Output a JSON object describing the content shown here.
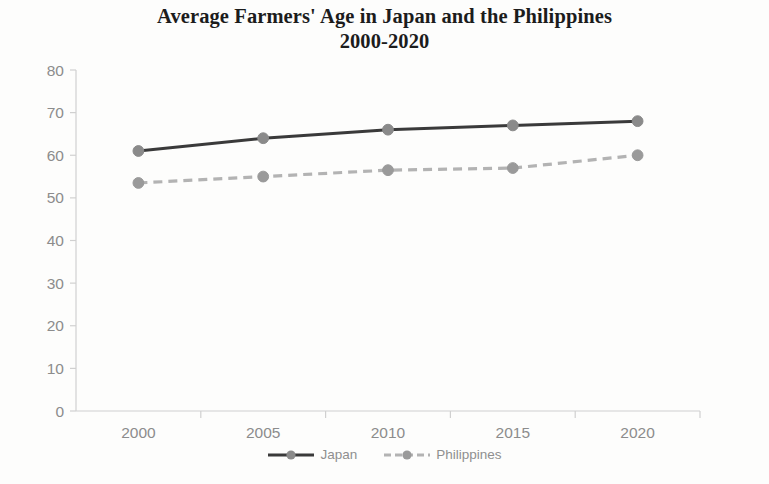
{
  "chart_data": {
    "type": "line",
    "title": "Average Farmers' Age in Japan and the Philippines 2000-2020",
    "title_line1": "Average Farmers' Age in Japan and the Philippines",
    "title_line2": "2000-2020",
    "xlabel": "",
    "ylabel": "",
    "categories": [
      "2000",
      "2005",
      "2010",
      "2015",
      "2020"
    ],
    "x": [
      2000,
      2005,
      2010,
      2015,
      2020
    ],
    "ylim": [
      0,
      80
    ],
    "yticks": [
      "0",
      "10",
      "20",
      "30",
      "40",
      "50",
      "60",
      "70",
      "80"
    ],
    "ytick_values": [
      0,
      10,
      20,
      30,
      40,
      50,
      60,
      70,
      80
    ],
    "grid": false,
    "legend_position": "bottom-center",
    "series": [
      {
        "name": "Japan",
        "values": [
          61,
          64,
          66,
          67,
          68
        ],
        "color": "#3a3a3a",
        "marker_color": "#8a8a8a",
        "line_style": "solid",
        "marker": "circle"
      },
      {
        "name": "Philippines",
        "values": [
          53.5,
          55,
          56.5,
          57,
          60
        ],
        "color": "#b3b3b3",
        "marker_color": "#9a9a9a",
        "line_style": "dashed",
        "marker": "circle"
      }
    ]
  },
  "axis": {
    "line_color": "#d0d0d0",
    "tick_label_color": "#8c8c8c"
  },
  "legend": {
    "items": [
      {
        "label": "Japan"
      },
      {
        "label": "Philippines"
      }
    ]
  }
}
